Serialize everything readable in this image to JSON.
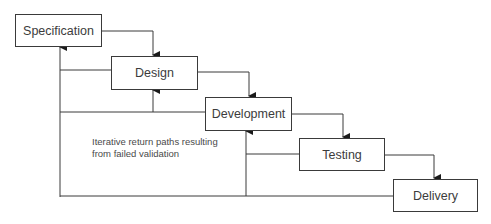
{
  "diagram": {
    "type": "waterfall-process",
    "stages": [
      {
        "id": "specification",
        "label": "Specification"
      },
      {
        "id": "design",
        "label": "Design"
      },
      {
        "id": "development",
        "label": "Development"
      },
      {
        "id": "testing",
        "label": "Testing"
      },
      {
        "id": "delivery",
        "label": "Delivery"
      }
    ],
    "note": "Iterative return paths resulting from failed validation",
    "colors": {
      "line": "#3a3a3a",
      "text": "#3c3c3c",
      "background": "#ffffff"
    }
  }
}
